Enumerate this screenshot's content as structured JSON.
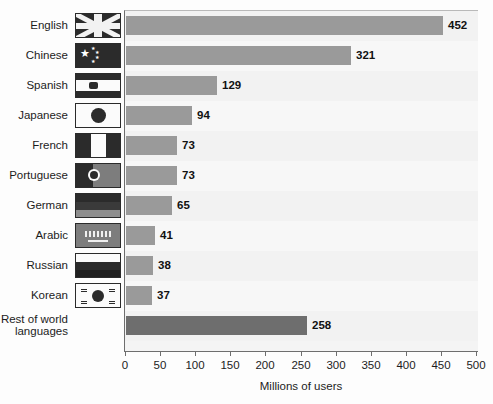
{
  "chart_data": {
    "type": "bar",
    "orientation": "horizontal",
    "title": "",
    "xlabel": "Millions of users",
    "ylabel": "",
    "xlim": [
      0,
      500
    ],
    "xticks": [
      0,
      50,
      100,
      150,
      200,
      250,
      300,
      350,
      400,
      450,
      500
    ],
    "xtick_labels": [
      "0",
      "50",
      "100",
      "150",
      "200",
      "250",
      "300",
      "350",
      "400",
      "450",
      "500"
    ],
    "grid": false,
    "legend": "none",
    "categories": [
      "English",
      "Chinese",
      "Spanish",
      "Japanese",
      "French",
      "Portuguese",
      "German",
      "Arabic",
      "Russian",
      "Korean",
      "Rest of world\nlanguages"
    ],
    "values": [
      452,
      321,
      129,
      94,
      73,
      73,
      65,
      41,
      38,
      37,
      258
    ],
    "value_labels": [
      "452",
      "321",
      "129",
      "94",
      "73",
      "73",
      "65",
      "41",
      "38",
      "37",
      "258"
    ],
    "colors": {
      "bar": "#9a9a9a",
      "bar_other": "#6e6e6e",
      "plot_background": "#f4f4f4",
      "axis": "#6e6e6e",
      "text": "#1c1c1c"
    },
    "flags": [
      {
        "country": "United Kingdom",
        "icon": "flag-united-kingdom-icon"
      },
      {
        "country": "China",
        "icon": "flag-china-icon"
      },
      {
        "country": "Spain",
        "icon": "flag-spain-icon"
      },
      {
        "country": "Japan",
        "icon": "flag-japan-icon"
      },
      {
        "country": "France",
        "icon": "flag-france-icon"
      },
      {
        "country": "Portugal",
        "icon": "flag-portugal-icon"
      },
      {
        "country": "Germany",
        "icon": "flag-germany-icon"
      },
      {
        "country": "Saudi Arabia",
        "icon": "flag-saudi-arabia-icon"
      },
      {
        "country": "Russia",
        "icon": "flag-russia-icon"
      },
      {
        "country": "South Korea",
        "icon": "flag-south-korea-icon"
      },
      {
        "country": "",
        "icon": "none"
      }
    ]
  }
}
